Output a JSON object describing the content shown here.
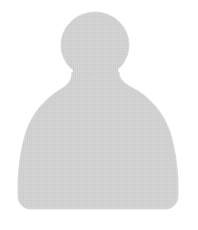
{
  "image": {
    "kind": "avatar-placeholder",
    "alt_text": "Generic person silhouette avatar placeholder",
    "width": 198,
    "height": 230
  },
  "colors": {
    "background": "#ffffff",
    "silhouette_fill": "#c9c9c9",
    "silhouette_edge": "#d4d4d4"
  },
  "figure": {
    "head": {
      "label": "head",
      "shape": "circle",
      "center_x": 95,
      "center_y": 45,
      "radius_x": 34,
      "radius_y": 33
    },
    "body": {
      "label": "shoulders-and-torso",
      "shape": "rounded-bell",
      "left": 18,
      "right": 178,
      "top": 72,
      "bottom": 209,
      "neck_left": 72,
      "neck_right": 119,
      "corner_radius": 13
    }
  },
  "texture": {
    "pattern": "halftone-dither",
    "opacity": 0.2
  }
}
